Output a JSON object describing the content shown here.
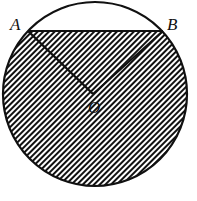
{
  "diagram": {
    "type": "circle-geometry",
    "labels": {
      "A": "A",
      "B": "B",
      "O": "O"
    },
    "colors": {
      "stroke": "#111111",
      "hatch": "#111111",
      "background": "#ffffff"
    },
    "shading": "diagonal-hatch"
  }
}
